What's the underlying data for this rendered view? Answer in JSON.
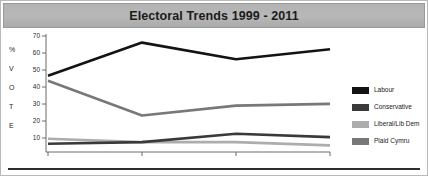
{
  "window": {
    "title": "Electoral Trends 1999 - 2011"
  },
  "chart_data": {
    "type": "line",
    "title": "Electoral Trends 1999 - 2011",
    "xlabel": "YEAR",
    "ylabel": "%VOTE",
    "ylabel_letters": [
      "%",
      "V",
      "O",
      "T",
      "E"
    ],
    "categories": [
      "1999",
      "2003",
      "2007",
      "2011"
    ],
    "x": [
      1999,
      2003,
      2007,
      2011
    ],
    "ylim": [
      0,
      70
    ],
    "xlim": [
      1999,
      2011
    ],
    "yticks": [
      70,
      60,
      50,
      40,
      30,
      20,
      10
    ],
    "grid": false,
    "legend_position": "right",
    "series": [
      {
        "name": "Labour",
        "color": "#131313",
        "values": [
          46,
          66,
          56,
          62
        ]
      },
      {
        "name": "Conservative",
        "color": "#3a3a3a",
        "values": [
          5,
          6,
          11,
          9
        ]
      },
      {
        "name": "Liberal/Lib Dem",
        "color": "#adadad",
        "values": [
          8,
          6,
          6,
          4
        ]
      },
      {
        "name": "Plaid Cymru",
        "color": "#787878",
        "values": [
          43,
          22,
          28,
          29
        ]
      }
    ]
  },
  "legend": {
    "items": [
      {
        "label": "Labour",
        "color": "#131313"
      },
      {
        "label": "Conservative",
        "color": "#3a3a3a"
      },
      {
        "label": "Liberal/Lib Dem",
        "color": "#adadad"
      },
      {
        "label": "Plaid Cymru",
        "color": "#787878"
      }
    ]
  },
  "axes": {
    "y_ticks": [
      "70",
      "60",
      "50",
      "40",
      "30",
      "20",
      "10"
    ],
    "x_ticks": [
      "1999",
      "2003",
      "2007",
      "2011"
    ],
    "x_axis_title": "YEAR"
  },
  "colors": {
    "banner": "#b3b3b3",
    "axis": "#6a6a6a",
    "text": "#2a2a2a",
    "rule": "#2e2e2e"
  }
}
